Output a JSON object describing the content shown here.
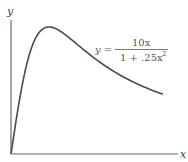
{
  "chart_data": {
    "type": "line",
    "title": "",
    "xlabel": "x",
    "ylabel": "y",
    "function": "y = 10x / (1 + .25x^2)",
    "equation_label": {
      "lhs": "y =",
      "numerator": "10x",
      "denominator": "1 + .25x",
      "exponent": "2"
    },
    "xlim": [
      0,
      8.8
    ],
    "ylim": [
      0,
      10.5
    ],
    "grid": false,
    "legend": "none",
    "ticks": "none",
    "x": [
      0,
      0.5,
      1,
      1.5,
      2,
      2.5,
      3,
      3.5,
      4,
      4.5,
      5,
      5.5,
      6,
      6.5,
      7,
      7.5,
      8
    ],
    "values": [
      0,
      4.71,
      8.0,
      9.6,
      10.0,
      9.76,
      9.23,
      8.62,
      8.0,
      7.42,
      6.9,
      6.42,
      6.0,
      5.62,
      5.28,
      4.97,
      4.71
    ],
    "annotations": [
      "peak at x=2, y=10"
    ]
  },
  "axes": {
    "x_label": "x",
    "y_label": "y"
  }
}
